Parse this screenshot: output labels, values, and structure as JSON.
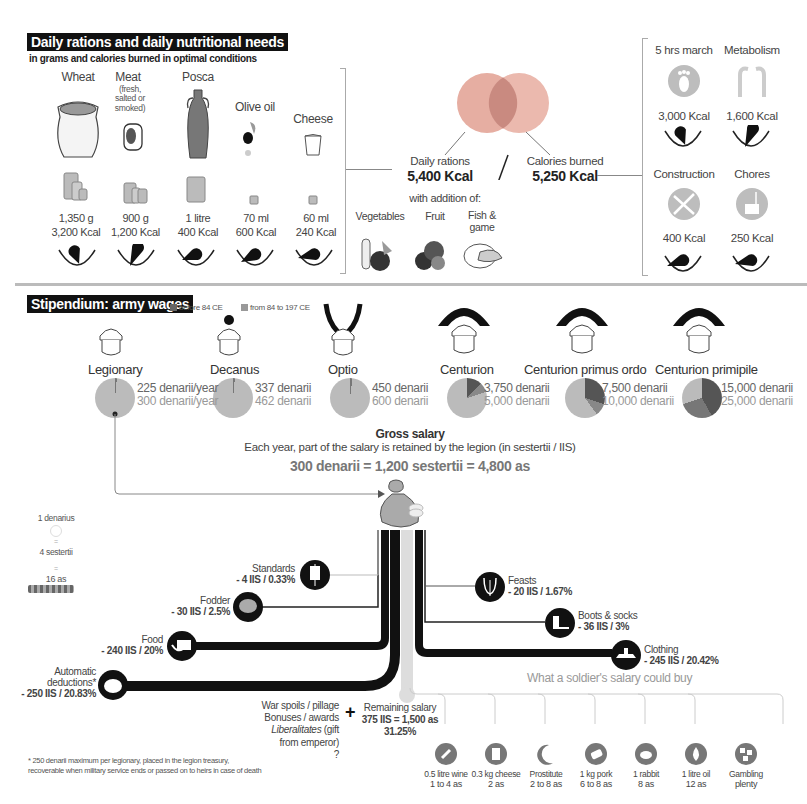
{
  "rations": {
    "title": "Daily rations and daily nutritional needs",
    "subtitle": "in grams and calories burned in optimal conditions",
    "items": [
      {
        "name": "Wheat",
        "note": "",
        "amount": "1,350 g",
        "kcal": "3,200 Kcal",
        "icon": "grain-sack-icon"
      },
      {
        "name": "Meat",
        "note": "(fresh, salted or smoked)",
        "amount": "900 g",
        "kcal": "1,200 Kcal",
        "icon": "meat-icon"
      },
      {
        "name": "Posca",
        "note": "",
        "amount": "1 litre",
        "kcal": "400 Kcal",
        "icon": "amphora-icon"
      },
      {
        "name": "Olive oil",
        "note": "",
        "amount": "70 ml",
        "kcal": "600 Kcal",
        "icon": "olive-icon"
      },
      {
        "name": "Cheese",
        "note": "",
        "amount": "60 ml",
        "kcal": "240 Kcal",
        "icon": "cheese-icon"
      }
    ],
    "daily_rations_label": "Daily rations",
    "daily_rations_value": "5,400 Kcal",
    "calories_burned_label": "Calories burned",
    "calories_burned_value": "5,250 Kcal",
    "addition_label": "with addition of:",
    "additions": [
      {
        "name": "Vegetables",
        "icon": "vegetables-icon"
      },
      {
        "name": "Fruit",
        "icon": "fruit-icon"
      },
      {
        "name": "Fish & game",
        "icon": "fish-game-icon"
      }
    ],
    "activities": [
      {
        "name": "5 hrs march",
        "kcal": "3,000 Kcal",
        "icon": "foot-icon"
      },
      {
        "name": "Metabolism",
        "kcal": "1,600 Kcal",
        "icon": "body-icon"
      },
      {
        "name": "Construction",
        "kcal": "400 Kcal",
        "icon": "pickaxe-shovel-icon"
      },
      {
        "name": "Chores",
        "kcal": "250 Kcal",
        "icon": "bucket-icon"
      }
    ],
    "colors": {
      "rations": "#e3a79b",
      "burned": "#e9b4a8",
      "overlap": "#c98a80"
    }
  },
  "wages": {
    "title": "Stipendium: army wages",
    "legend": [
      {
        "label": "before 84 CE",
        "color": "#666666"
      },
      {
        "label": "from 84 to 197 CE",
        "color": "#999999"
      }
    ],
    "ranks": [
      {
        "name": "Legionary",
        "before": "225 denarii/year",
        "after": "300 denarii/year",
        "icon": "helmet-plain-icon"
      },
      {
        "name": "Decanus",
        "before": "337 denarii",
        "after": "462 denarii",
        "icon": "helmet-crest-icon"
      },
      {
        "name": "Optio",
        "before": "450 denarii",
        "after": "600 denarii",
        "icon": "helmet-feathers-icon"
      },
      {
        "name": "Centurion",
        "before": "3,750 denarii",
        "after": "5,000 denarii",
        "icon": "helmet-transverse-crest-icon"
      },
      {
        "name": "Centurion primus ordo",
        "before": "7,500 denarii",
        "after": "10,000 denarii",
        "icon": "helmet-transverse-crest-icon"
      },
      {
        "name": "Centurion primipile",
        "before": "15,000 denarii",
        "after": "25,000 denarii",
        "icon": "helmet-transverse-crest-icon"
      }
    ]
  },
  "salary": {
    "heading": "Gross salary",
    "subheading": "Each year, part of the salary is retained by the legion (in sestertii / IIS)",
    "equation": "300 denarii = 1,200 sestertii = 4,800 as",
    "currency_key": {
      "denarius": "1 denarius",
      "eq1": "=",
      "sestertii": "4 sestertii",
      "eq2": "=",
      "as": "16 as"
    },
    "deductions_left": [
      {
        "name": "Standards",
        "value": "- 4 IIS / 0.33%",
        "icon": "standard-icon"
      },
      {
        "name": "Fodder",
        "value": "- 30 IIS / 2.5%",
        "icon": "fodder-icon"
      },
      {
        "name": "Food",
        "value": "- 240 IIS / 20%",
        "icon": "food-icon"
      },
      {
        "name": "Automatic deductions*",
        "value": "- 250 IIS / 20.83%",
        "icon": "piggy-bank-icon"
      }
    ],
    "deductions_right": [
      {
        "name": "Feasts",
        "value": "- 20 IIS / 1.67%",
        "icon": "lyre-icon"
      },
      {
        "name": "Boots & socks",
        "value": "- 36 IIS / 3%",
        "icon": "sandal-icon"
      },
      {
        "name": "Clothing",
        "value": "- 245 IIS / 20.42%",
        "icon": "tunic-icon"
      }
    ],
    "extras": [
      "War spoils / pillage",
      "Bonuses / awards",
      "Liberalitates",
      "(gift",
      "from emperor)",
      "?"
    ],
    "plus": "+",
    "remaining_label": "Remaining salary",
    "remaining_value": "375 IIS = 1,500 as",
    "remaining_pct": "31.25%",
    "footnote_1": "* 250 denarii maximum per legionary, placed in the legion treasury,",
    "footnote_2": "recoverable when military service ends or passed on to heirs in case of death"
  },
  "purchases": {
    "title": "What a soldier's salary could buy",
    "items": [
      {
        "name": "0.5 litre wine",
        "price": "1 to 4 as",
        "icon": "wine-icon"
      },
      {
        "name": "0.3 kg cheese",
        "price": "2 as",
        "icon": "cheese-icon"
      },
      {
        "name": "Prostitute",
        "price": "2 to 8 as",
        "icon": "moon-figure-icon"
      },
      {
        "name": "1 kg pork",
        "price": "6 to 8 as",
        "icon": "pork-icon"
      },
      {
        "name": "1 rabbit",
        "price": "8 as",
        "icon": "rabbit-icon"
      },
      {
        "name": "1 litre oil",
        "price": "12 as",
        "icon": "oil-drop-icon"
      },
      {
        "name": "Gambling",
        "price": "plenty",
        "icon": "dice-icon"
      }
    ]
  }
}
